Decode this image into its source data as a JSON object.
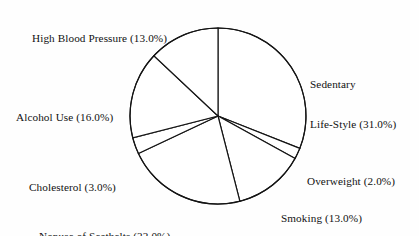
{
  "figure": {
    "background_color": "#fefefe",
    "line_color": "#141414",
    "slice_fill_color": "#ffffff"
  },
  "chart_data": {
    "type": "pie",
    "title": "",
    "subtitle": "",
    "xlabel": "",
    "ylabel": "",
    "legend_position": "none",
    "grid": false,
    "start_angle_deg": 90,
    "direction": "clockwise",
    "units": "percent",
    "total": 100.0,
    "categories": [
      "Sedentary Life-Style",
      "Overweight",
      "Smoking",
      "Nonuse of Seatbelts",
      "Cholesterol",
      "Alcohol Use",
      "High Blood Pressure"
    ],
    "values": [
      31.0,
      2.0,
      13.0,
      22.0,
      3.0,
      16.0,
      13.0
    ],
    "slices": [
      {
        "label": "Sedentary Life-Style",
        "value": 31.0,
        "display": "Sedentary\nLife-Style (31.0%)"
      },
      {
        "label": "Overweight",
        "value": 2.0,
        "display": "Overweight (2.0%)"
      },
      {
        "label": "Smoking",
        "value": 13.0,
        "display": "Smoking (13.0%)"
      },
      {
        "label": "Nonuse of Seatbelts",
        "value": 22.0,
        "display": "Nonuse of Seatbelts (22.0%)"
      },
      {
        "label": "Cholesterol",
        "value": 3.0,
        "display": "Cholesterol (3.0%)"
      },
      {
        "label": "Alcohol Use",
        "value": 16.0,
        "display": "Alcohol Use (16.0%)"
      },
      {
        "label": "High Blood Pressure",
        "value": 13.0,
        "display": "High Blood Pressure (13.0%)"
      }
    ]
  },
  "labels": {
    "high_blood_pressure": "High Blood Pressure (13.0%)",
    "sedentary_line1": "Sedentary",
    "sedentary_line2": "Life-Style (31.0%)",
    "alcohol_use": "Alcohol Use (16.0%)",
    "cholesterol": "Cholesterol (3.0%)",
    "overweight": "Overweight (2.0%)",
    "smoking": "Smoking (13.0%)",
    "nonuse_of_seatbelts": "Nonuse of Seatbelts (22.0%)"
  }
}
